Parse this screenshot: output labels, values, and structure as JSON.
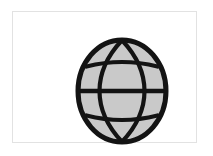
{
  "app": {
    "title": "Globe Icon",
    "background_color": "#ffffff"
  },
  "card": {
    "name": "image-card",
    "background_color": "#ffffff",
    "border_color": "#e2e2e2",
    "border_width_px": 1
  },
  "graphic": {
    "label": "globe",
    "alt_text": "Globe",
    "fill_color": "#c9c9c9",
    "line_color": "#131313",
    "outer_stroke_px": 5,
    "inner_stroke_px": 4.2,
    "parts": [
      {
        "name": "outer-circle",
        "type": "ellipse",
        "cx": 48,
        "cy": 56,
        "rx": 44,
        "ry": 51
      },
      {
        "name": "meridian-left",
        "type": "ellipse",
        "cx": 48,
        "cy": 56,
        "rx": 22,
        "ry": 51
      },
      {
        "name": "meridian-right",
        "type": "ellipse",
        "cx": 48,
        "cy": 56,
        "rx": 22,
        "ry": 51
      },
      {
        "name": "latitude-upper",
        "type": "arc",
        "curve": "convex-up",
        "y": 27
      },
      {
        "name": "latitude-equator",
        "type": "line",
        "y": 56
      },
      {
        "name": "latitude-lower",
        "type": "arc",
        "curve": "convex-down",
        "y": 85
      }
    ],
    "meridian_count": 2,
    "latitude_count": 3
  }
}
